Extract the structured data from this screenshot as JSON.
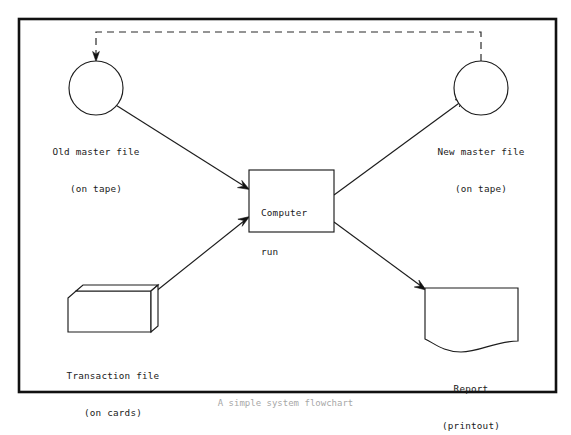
{
  "figure": {
    "caption": "A simple system flowchart",
    "frame": {
      "x": 19,
      "y": 19,
      "width": 537,
      "height": 373
    }
  },
  "nodes": {
    "old_master": {
      "symbol": "tape-reel-circle",
      "label_line1": "Old master file",
      "label_line2": "(on tape)",
      "cx": 96,
      "cy": 88,
      "r": 27
    },
    "new_master": {
      "symbol": "tape-reel-circle",
      "label_line1": "New master file",
      "label_line2": "(on tape)",
      "cx": 481,
      "cy": 88,
      "r": 27
    },
    "computer_run": {
      "symbol": "process-rectangle",
      "text_line1": "Computer",
      "text_line2": "run",
      "x": 249,
      "y": 170,
      "width": 85,
      "height": 62
    },
    "transaction_file": {
      "symbol": "punched-card-deck",
      "label_line1": "Transaction file",
      "label_line2": "(on cards)",
      "x": 68,
      "y": 288,
      "width": 90,
      "height": 44
    },
    "report": {
      "symbol": "document-printout",
      "label_line1": "Report",
      "label_line2": "(printout)",
      "x": 425,
      "y": 288,
      "width": 93,
      "height": 64
    }
  },
  "connectors": [
    {
      "name": "old-master-to-computer-run",
      "style": "solid",
      "from": "old_master",
      "to": "computer_run"
    },
    {
      "name": "transaction-file-to-computer-run",
      "style": "solid",
      "from": "transaction_file",
      "to": "computer_run"
    },
    {
      "name": "computer-run-to-new-master",
      "style": "solid",
      "from": "computer_run",
      "to": "new_master"
    },
    {
      "name": "computer-run-to-report",
      "style": "solid",
      "from": "computer_run",
      "to": "report"
    },
    {
      "name": "new-master-to-old-master-feedback",
      "style": "dashed",
      "from": "new_master",
      "to": "old_master"
    }
  ],
  "colors": {
    "ink": "#1c1c1c",
    "frame": "#111111",
    "paper": "#ffffff",
    "dashed": "#2b2b2b"
  }
}
